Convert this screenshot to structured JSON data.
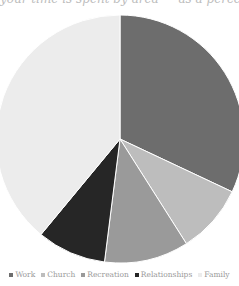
{
  "header": {
    "title_partial": "your time is spent by area — as a percent of time",
    "title_note": "title clipped at top edge; text uncertain"
  },
  "legend": {
    "items": [
      {
        "label": "Work",
        "color": "#6d6d6d"
      },
      {
        "label": "Church",
        "color": "#bdbdbd"
      },
      {
        "label": "Recreation",
        "color": "#9a9a9a"
      },
      {
        "label": "Relationships",
        "color": "#262626"
      },
      {
        "label": "Family",
        "color": "#ececec"
      }
    ]
  },
  "chart_data": {
    "type": "pie",
    "title": "your time is spent by area — as a percent of time",
    "categories": [
      "Work",
      "Church",
      "Recreation",
      "Relationships",
      "Family"
    ],
    "values": [
      32,
      9,
      11,
      9,
      39
    ],
    "units": "percent (approximate)",
    "values_note": "estimated from slice angles; chart has no data labels",
    "colors": [
      "#6d6d6d",
      "#bdbdbd",
      "#9a9a9a",
      "#262626",
      "#ececec"
    ],
    "start_angle_deg": 0,
    "direction": "clockwise",
    "legend_position": "bottom",
    "grid": false
  }
}
